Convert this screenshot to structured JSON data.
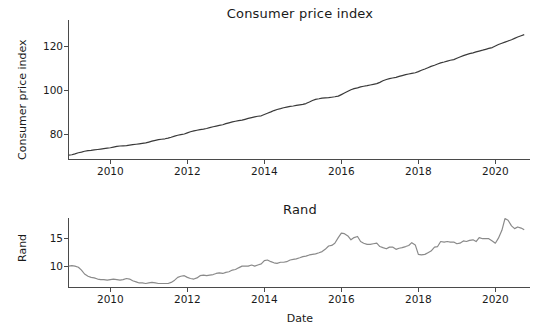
{
  "figure": {
    "xlabel": "Date",
    "background": "#ffffff",
    "line_color_cpi": "#3a3a3a",
    "line_color_rand": "#8a8a8a",
    "axis_color": "#4a4a4a"
  },
  "chart_data": [
    {
      "type": "line",
      "title": "Consumer price index",
      "xlabel": "",
      "ylabel": "Consumer price index",
      "xlim": [
        2008.9,
        2020.9
      ],
      "ylim": [
        68,
        132
      ],
      "yticks": [
        80,
        100,
        120
      ],
      "xticks": [
        2010,
        2012,
        2014,
        2016,
        2018,
        2020
      ],
      "grid": false,
      "legend": "none",
      "series": [
        {
          "name": "Consumer price index",
          "x": [
            2008.92,
            2009.0,
            2009.08,
            2009.17,
            2009.25,
            2009.33,
            2009.42,
            2009.5,
            2009.58,
            2009.67,
            2009.75,
            2009.83,
            2009.92,
            2010.0,
            2010.08,
            2010.17,
            2010.25,
            2010.33,
            2010.42,
            2010.5,
            2010.58,
            2010.67,
            2010.75,
            2010.83,
            2010.92,
            2011.0,
            2011.08,
            2011.17,
            2011.25,
            2011.33,
            2011.42,
            2011.5,
            2011.58,
            2011.67,
            2011.75,
            2011.83,
            2011.92,
            2012.0,
            2012.08,
            2012.17,
            2012.25,
            2012.33,
            2012.42,
            2012.5,
            2012.58,
            2012.67,
            2012.75,
            2012.83,
            2012.92,
            2013.0,
            2013.08,
            2013.17,
            2013.25,
            2013.33,
            2013.42,
            2013.5,
            2013.58,
            2013.67,
            2013.75,
            2013.83,
            2013.92,
            2014.0,
            2014.08,
            2014.17,
            2014.25,
            2014.33,
            2014.42,
            2014.5,
            2014.58,
            2014.67,
            2014.75,
            2014.83,
            2014.92,
            2015.0,
            2015.08,
            2015.17,
            2015.25,
            2015.33,
            2015.42,
            2015.5,
            2015.58,
            2015.67,
            2015.75,
            2015.83,
            2015.92,
            2016.0,
            2016.08,
            2016.17,
            2016.25,
            2016.33,
            2016.42,
            2016.5,
            2016.58,
            2016.67,
            2016.75,
            2016.83,
            2016.92,
            2017.0,
            2017.08,
            2017.17,
            2017.25,
            2017.33,
            2017.42,
            2017.5,
            2017.58,
            2017.67,
            2017.75,
            2017.83,
            2017.92,
            2018.0,
            2018.08,
            2018.17,
            2018.25,
            2018.33,
            2018.42,
            2018.5,
            2018.58,
            2018.67,
            2018.75,
            2018.83,
            2018.92,
            2019.0,
            2019.08,
            2019.17,
            2019.25,
            2019.33,
            2019.42,
            2019.5,
            2019.58,
            2019.67,
            2019.75,
            2019.83,
            2019.92,
            2020.0,
            2020.08,
            2020.17,
            2020.25,
            2020.33,
            2020.42,
            2020.5,
            2020.58,
            2020.67,
            2020.75
          ],
          "y": [
            70.2,
            70.4,
            70.8,
            71.3,
            71.6,
            72.0,
            72.3,
            72.4,
            72.6,
            72.8,
            73.0,
            73.2,
            73.4,
            73.6,
            73.9,
            74.2,
            74.4,
            74.5,
            74.6,
            74.8,
            75.0,
            75.2,
            75.4,
            75.6,
            75.8,
            76.2,
            76.6,
            77.0,
            77.3,
            77.5,
            77.7,
            78.0,
            78.4,
            78.9,
            79.3,
            79.6,
            79.9,
            80.4,
            80.9,
            81.3,
            81.6,
            81.9,
            82.1,
            82.4,
            82.8,
            83.2,
            83.5,
            83.8,
            84.1,
            84.6,
            85.0,
            85.4,
            85.7,
            86.0,
            86.2,
            86.6,
            87.0,
            87.4,
            87.7,
            88.0,
            88.2,
            88.8,
            89.4,
            90.0,
            90.6,
            91.1,
            91.5,
            91.9,
            92.2,
            92.5,
            92.7,
            93.0,
            93.2,
            93.4,
            93.8,
            94.5,
            95.2,
            95.7,
            96.0,
            96.3,
            96.4,
            96.5,
            96.7,
            96.9,
            97.2,
            97.9,
            98.6,
            99.4,
            100.1,
            100.6,
            101.0,
            101.4,
            101.7,
            102.0,
            102.3,
            102.6,
            102.9,
            103.5,
            104.2,
            104.8,
            105.2,
            105.5,
            105.8,
            106.2,
            106.6,
            107.0,
            107.3,
            107.6,
            107.9,
            108.4,
            109.0,
            109.6,
            110.2,
            110.8,
            111.3,
            111.9,
            112.4,
            112.8,
            113.2,
            113.6,
            113.9,
            114.5,
            115.1,
            115.7,
            116.2,
            116.6,
            117.0,
            117.4,
            117.8,
            118.2,
            118.6,
            119.0,
            119.4,
            120.1,
            120.8,
            121.4,
            121.9,
            122.4,
            123.0,
            123.6,
            124.2,
            124.8,
            125.3
          ]
        }
      ]
    },
    {
      "type": "line",
      "title": "Rand",
      "xlabel": "Date",
      "ylabel": "Rand",
      "xlim": [
        2008.9,
        2020.9
      ],
      "ylim": [
        6.0,
        18.5
      ],
      "yticks": [
        10,
        15
      ],
      "xticks": [
        2010,
        2012,
        2014,
        2016,
        2018,
        2020
      ],
      "grid": false,
      "legend": "none",
      "series": [
        {
          "name": "Rand",
          "x": [
            2008.92,
            2009.0,
            2009.08,
            2009.17,
            2009.25,
            2009.33,
            2009.42,
            2009.5,
            2009.58,
            2009.67,
            2009.75,
            2009.83,
            2009.92,
            2010.0,
            2010.08,
            2010.17,
            2010.25,
            2010.33,
            2010.42,
            2010.5,
            2010.58,
            2010.67,
            2010.75,
            2010.83,
            2010.92,
            2011.0,
            2011.08,
            2011.17,
            2011.25,
            2011.33,
            2011.42,
            2011.5,
            2011.58,
            2011.67,
            2011.75,
            2011.83,
            2011.92,
            2012.0,
            2012.08,
            2012.17,
            2012.25,
            2012.33,
            2012.42,
            2012.5,
            2012.58,
            2012.67,
            2012.75,
            2012.83,
            2012.92,
            2013.0,
            2013.08,
            2013.17,
            2013.25,
            2013.33,
            2013.42,
            2013.5,
            2013.58,
            2013.67,
            2013.75,
            2013.83,
            2013.92,
            2014.0,
            2014.08,
            2014.17,
            2014.25,
            2014.33,
            2014.42,
            2014.5,
            2014.58,
            2014.67,
            2014.75,
            2014.83,
            2014.92,
            2015.0,
            2015.08,
            2015.17,
            2015.25,
            2015.33,
            2015.42,
            2015.5,
            2015.58,
            2015.67,
            2015.75,
            2015.83,
            2015.92,
            2016.0,
            2016.08,
            2016.17,
            2016.25,
            2016.33,
            2016.42,
            2016.5,
            2016.58,
            2016.67,
            2016.75,
            2016.83,
            2016.92,
            2017.0,
            2017.08,
            2017.17,
            2017.25,
            2017.33,
            2017.42,
            2017.5,
            2017.58,
            2017.67,
            2017.75,
            2017.83,
            2017.92,
            2018.0,
            2018.08,
            2018.17,
            2018.25,
            2018.33,
            2018.42,
            2018.5,
            2018.58,
            2018.67,
            2018.75,
            2018.83,
            2018.92,
            2019.0,
            2019.08,
            2019.17,
            2019.25,
            2019.33,
            2019.42,
            2019.5,
            2019.58,
            2019.67,
            2019.75,
            2019.83,
            2019.92,
            2020.0,
            2020.08,
            2020.17,
            2020.25,
            2020.33,
            2020.42,
            2020.5,
            2020.58,
            2020.67,
            2020.75
          ],
          "y": [
            9.9,
            10.0,
            9.9,
            9.7,
            9.2,
            8.5,
            8.1,
            7.9,
            7.8,
            7.6,
            7.5,
            7.5,
            7.4,
            7.5,
            7.6,
            7.5,
            7.4,
            7.5,
            7.7,
            7.6,
            7.3,
            7.1,
            6.9,
            6.9,
            6.8,
            6.9,
            7.0,
            6.9,
            6.8,
            6.8,
            6.8,
            6.8,
            7.0,
            7.4,
            7.9,
            8.1,
            8.2,
            7.9,
            7.7,
            7.6,
            7.8,
            8.2,
            8.3,
            8.2,
            8.3,
            8.4,
            8.6,
            8.7,
            8.6,
            8.8,
            8.9,
            9.2,
            9.3,
            9.6,
            9.9,
            9.9,
            9.9,
            10.1,
            9.9,
            10.1,
            10.3,
            10.9,
            11.0,
            10.7,
            10.5,
            10.4,
            10.6,
            10.6,
            10.7,
            11.0,
            11.1,
            11.2,
            11.4,
            11.6,
            11.7,
            11.9,
            12.0,
            12.1,
            12.3,
            12.5,
            12.9,
            13.5,
            13.6,
            14.0,
            15.0,
            15.8,
            15.7,
            15.3,
            14.6,
            15.0,
            15.2,
            14.3,
            14.0,
            13.8,
            13.8,
            13.9,
            14.0,
            13.4,
            13.2,
            13.0,
            13.3,
            13.3,
            12.9,
            13.1,
            13.2,
            13.4,
            13.6,
            14.1,
            13.7,
            12.0,
            11.9,
            12.0,
            12.3,
            12.6,
            13.3,
            13.4,
            14.3,
            14.2,
            14.3,
            14.2,
            14.2,
            13.9,
            14.0,
            14.4,
            14.3,
            14.5,
            14.6,
            14.3,
            15.0,
            14.8,
            14.8,
            14.8,
            14.4,
            14.0,
            14.9,
            16.3,
            18.4,
            18.1,
            17.1,
            16.6,
            16.9,
            16.7,
            16.4
          ]
        }
      ]
    }
  ]
}
